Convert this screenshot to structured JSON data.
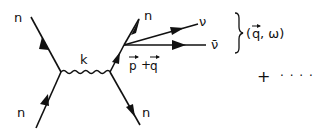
{
  "diagram": {
    "type": "feynman-diagram",
    "particles": {
      "incoming_left": "n",
      "outgoing_left": "n",
      "incoming_right": "n",
      "outgoing_right": "n",
      "neutrino": "ν",
      "antineutrino": "ν̄"
    },
    "propagator_label": "k",
    "momentum_label": {
      "p": "p",
      "plus": "+",
      "q": "q"
    },
    "pair_label": "(q, ω)",
    "pair_label_parts": {
      "open": "(",
      "q": "q",
      "sep": ", ω)"
    },
    "continuation": {
      "plus": "+",
      "dots": "· · · ·"
    },
    "colors": {
      "ink": "#111111",
      "background": "#ffffff"
    }
  }
}
